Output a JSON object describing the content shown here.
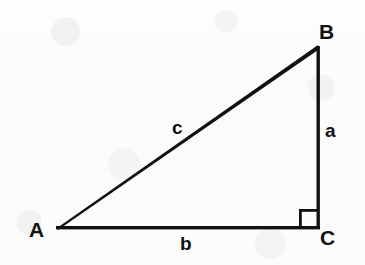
{
  "figure": {
    "kind": "right-triangle-diagram",
    "background_color": "#fdfdfd",
    "stroke_color": "#111111",
    "canvas": {
      "width": 365,
      "height": 265
    }
  },
  "vertices": [
    {
      "id": "A",
      "label": "A",
      "x": 57,
      "y": 228
    },
    {
      "id": "B",
      "label": "B",
      "x": 318,
      "y": 47
    },
    {
      "id": "C",
      "label": "C",
      "x": 318,
      "y": 228
    }
  ],
  "sides": [
    {
      "id": "a",
      "label": "a",
      "from": "B",
      "to": "C",
      "role": "opposite-A-vertical-leg"
    },
    {
      "id": "b",
      "label": "b",
      "from": "A",
      "to": "C",
      "role": "opposite-B-horizontal-leg"
    },
    {
      "id": "c",
      "label": "c",
      "from": "A",
      "to": "B",
      "role": "hypotenuse"
    }
  ],
  "right_angle": {
    "at_vertex": "C",
    "marker": "square",
    "size": 18,
    "x": 300,
    "y": 209
  }
}
